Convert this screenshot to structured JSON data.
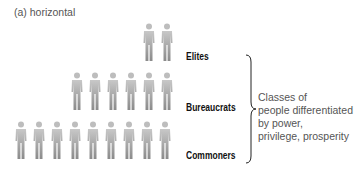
{
  "caption": "(a) horizontal",
  "classes": [
    {
      "label": "Elites",
      "count": 2
    },
    {
      "label": "Bureaucrats",
      "count": 6
    },
    {
      "label": "Commoners",
      "count": 9
    }
  ],
  "description": {
    "lines": [
      "Classes of",
      "people differentiated",
      "by power,",
      "privilege, prosperity"
    ]
  },
  "colors": {
    "figure_light": "#c8c8c8",
    "figure_dark": "#8a8a8a",
    "label": "#111111",
    "text": "#555555"
  }
}
